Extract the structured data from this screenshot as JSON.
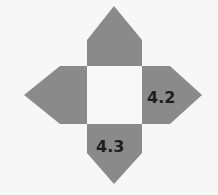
{
  "diagram": {
    "type": "net",
    "colors": {
      "arm": "#8a8a8a",
      "center": "#f8f8f8",
      "label": "#1e1e1e",
      "background": "#f7f7f7"
    },
    "center_square": {
      "x": 87,
      "y": 66,
      "width": 55,
      "height": 58
    },
    "arms": [
      {
        "position": "top",
        "label": ""
      },
      {
        "position": "left",
        "label": ""
      },
      {
        "position": "right",
        "label": "4.2"
      },
      {
        "position": "bottom",
        "label": "4.3"
      }
    ]
  }
}
